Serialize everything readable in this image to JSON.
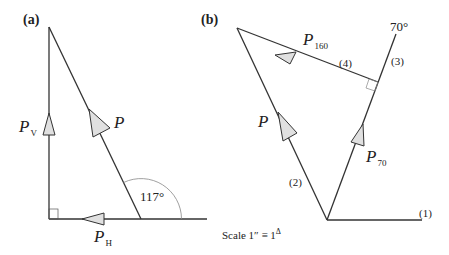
{
  "panel_a": {
    "label": "(a)",
    "forces": {
      "vertical": {
        "symbol": "P",
        "subscript": "V"
      },
      "horizontal": {
        "symbol": "P",
        "subscript": "H"
      },
      "resultant": {
        "symbol": "P"
      }
    },
    "angle_label": "117°"
  },
  "panel_b": {
    "label": "(b)",
    "forces": {
      "p160": {
        "symbol": "P",
        "subscript": "160"
      },
      "p": {
        "symbol": "P"
      },
      "p70": {
        "symbol": "P",
        "subscript": "70"
      }
    },
    "angle_label": "70°",
    "line_labels": [
      "(1)",
      "(2)",
      "(3)",
      "(4)"
    ],
    "scale_label": "Scale  1″ ≡ 1",
    "scale_unit": "Δ"
  },
  "colors": {
    "line": "#333333",
    "arrow_fill": "#e0e0e0",
    "arc": "#888888"
  }
}
